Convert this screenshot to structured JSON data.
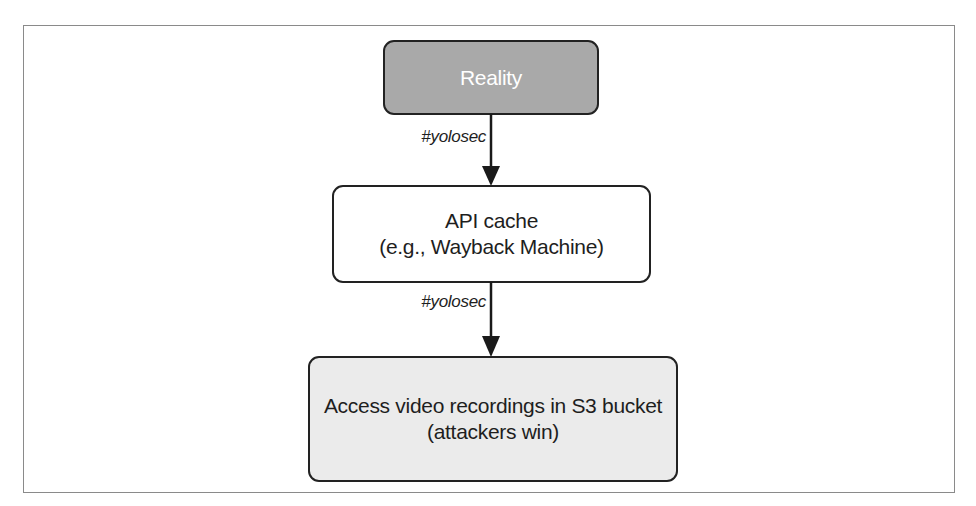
{
  "diagram": {
    "type": "flowchart",
    "direction": "top-to-bottom",
    "colors": {
      "frame_border": "#8a8a8a",
      "node_border": "#222222",
      "text": "#1e1e1e",
      "reality_fill": "#a9a9a9",
      "reality_text": "#ffffff",
      "cache_fill": "#ffffff",
      "access_fill": "#ebebeb",
      "arrow": "#1a1a1a"
    },
    "nodes": [
      {
        "id": "reality",
        "lines": [
          "Reality"
        ]
      },
      {
        "id": "api-cache",
        "lines": [
          "API cache",
          "(e.g., Wayback Machine)"
        ]
      },
      {
        "id": "access-recordings",
        "lines": [
          "Access video recordings in S3 bucket",
          "(attackers win)"
        ]
      }
    ],
    "edges": [
      {
        "from": "reality",
        "to": "api-cache",
        "label": "#yolosec"
      },
      {
        "from": "api-cache",
        "to": "access-recordings",
        "label": "#yolosec"
      }
    ]
  }
}
